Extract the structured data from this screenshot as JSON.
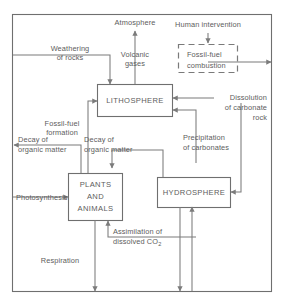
{
  "diagram": {
    "stroke_color": "#7b7b7b",
    "text_color": "#5d5d5d",
    "background_color": "#ffffff"
  },
  "reservoirs": [
    {
      "id": "lithosphere",
      "label": "LITHOSPHERE"
    },
    {
      "id": "hydrosphere",
      "label": "HYDROSPHERE"
    },
    {
      "id": "plants_animals",
      "label_line1": "PLANTS",
      "label_line2": "AND",
      "label_line3": "ANIMALS"
    }
  ],
  "dashed_box": {
    "id": "fossil_fuel_combustion",
    "label_line1": "Fossil-fuel",
    "label_line2": "combustion",
    "style": "dashed"
  },
  "labels": {
    "atmosphere": "Atmosphere",
    "human_intervention": "Human intervention",
    "volcanic_gases_line1": "Volcanic",
    "volcanic_gases_line2": "gases",
    "weathering_line1": "Weathering",
    "weathering_line2": "of rocks",
    "fossil_fuel_formation_line1": "Fossil-fuel",
    "fossil_fuel_formation_line2": "formation",
    "decay_left_line1": "Decay of",
    "decay_left_line2": "organic matter",
    "decay_right_line1": "Decay of",
    "decay_right_line2": "organic matter",
    "dissolution_line1": "Dissolution",
    "dissolution_line2": "of carbonate",
    "dissolution_line3": "rock",
    "precipitation_line1": "Precipitation",
    "precipitation_line2": "of carbonates",
    "photosynthesis": "Photosynthesis",
    "respiration": "Respiration",
    "assimilation_line1": "Assimilation of",
    "assimilation_line2_pre": "dissolved CO",
    "assimilation_line2_sub": "2"
  }
}
